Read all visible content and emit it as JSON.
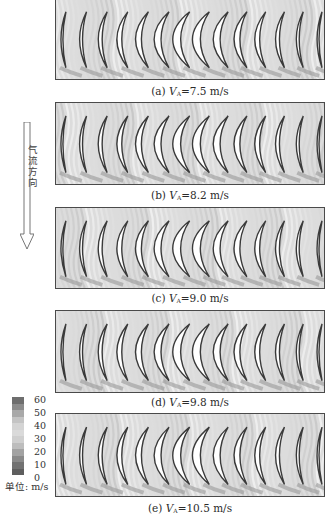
{
  "figure": {
    "panels": [
      {
        "id": "a",
        "label": "(a)",
        "var": "V",
        "sub": "A",
        "value": "=7.5 m/s",
        "top": -2,
        "height": 82,
        "caption_top": 85
      },
      {
        "id": "b",
        "label": "(b)",
        "var": "V",
        "sub": "A",
        "value": "=8.2 m/s",
        "top": 102,
        "height": 83,
        "caption_top": 189
      },
      {
        "id": "c",
        "label": "(c)",
        "var": "V",
        "sub": "A",
        "value": "=9.0 m/s",
        "top": 207,
        "height": 82,
        "caption_top": 292
      },
      {
        "id": "d",
        "label": "(d)",
        "var": "V",
        "sub": "A",
        "value": "=9.8 m/s",
        "top": 310,
        "height": 83,
        "caption_top": 396
      },
      {
        "id": "e",
        "label": "(e)",
        "var": "V",
        "sub": "A",
        "value": "=10.5 m/s",
        "top": 413,
        "height": 84,
        "caption_top": 502
      }
    ],
    "flow_direction_label": "气流方向",
    "colorbar": {
      "ticks": [
        "60",
        "50",
        "40",
        "30",
        "20",
        "10",
        "0"
      ],
      "unit_label": "单位: m/s",
      "colors": [
        "#6e6e6e",
        "#8c8c8c",
        "#a9a9a9",
        "#c4c4c4",
        "#d4d4d4",
        "#dadada",
        "#cfcfcf",
        "#bdbdbd",
        "#a3a3a3",
        "#8a8a8a",
        "#727272",
        "#5e5e5e"
      ]
    },
    "blade_count": 14
  }
}
